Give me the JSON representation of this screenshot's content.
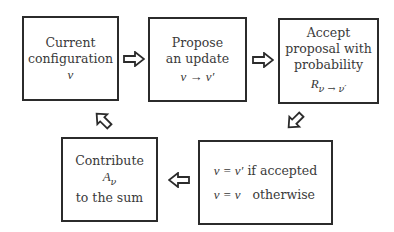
{
  "diagram": {
    "type": "flowchart-cycle",
    "nodes": [
      {
        "id": "current",
        "lines": [
          "Current",
          "configuration"
        ],
        "math": "ν"
      },
      {
        "id": "propose",
        "lines": [
          "Propose",
          "an update"
        ],
        "math": "ν → ν′"
      },
      {
        "id": "accept",
        "lines": [
          "Accept",
          "proposal with",
          "probability"
        ],
        "math_main": "R",
        "math_sub": "ν → ν′"
      },
      {
        "id": "update",
        "rows": [
          {
            "math": "ν = ν′",
            "text": "if accepted"
          },
          {
            "math": "ν = ν",
            "text": "otherwise"
          }
        ]
      },
      {
        "id": "contribute",
        "lines": [
          "Contribute",
          "to the sum"
        ],
        "math_main": "A",
        "math_sub": "ν"
      }
    ],
    "edges": [
      {
        "from": "current",
        "to": "propose",
        "icon": "hollow-arrow-right-icon"
      },
      {
        "from": "propose",
        "to": "accept",
        "icon": "hollow-arrow-right-icon"
      },
      {
        "from": "accept",
        "to": "update",
        "icon": "hollow-arrow-down-left-icon"
      },
      {
        "from": "update",
        "to": "contribute",
        "icon": "hollow-arrow-left-icon"
      },
      {
        "from": "contribute",
        "to": "current",
        "icon": "hollow-arrow-up-left-icon"
      }
    ]
  }
}
